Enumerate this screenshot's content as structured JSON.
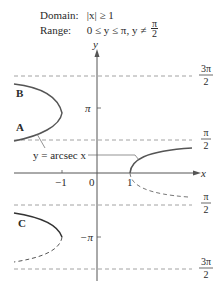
{
  "header": {
    "domain_label": "Domain:",
    "domain_value": "|x| ≥ 1",
    "range_label": "Range:",
    "range_value": "0 ≤ y ≤ π, y ≠",
    "range_frac_num": "π",
    "range_frac_den": "2"
  },
  "axes": {
    "x_label": "x",
    "y_label": "y",
    "x_ticks": [
      "−1",
      "0",
      "1"
    ],
    "y_ticks": [
      "π",
      "−π"
    ]
  },
  "asymptotes": [
    {
      "num": "3π",
      "den": "2"
    },
    {
      "num": "π",
      "den": "2"
    },
    {
      "num": "π",
      "den": "2"
    },
    {
      "num": "3π",
      "den": "2"
    }
  ],
  "curve_labels": {
    "a": "A",
    "b": "B",
    "c": "C"
  },
  "annotation": "y = arcsec x",
  "colors": {
    "curve": "#555555",
    "dash": "#888888",
    "axis": "#555555"
  }
}
